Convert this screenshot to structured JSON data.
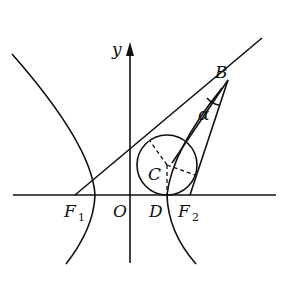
{
  "diagram": {
    "type": "hyperbola-focal-triangle",
    "axes": {
      "x_label": "",
      "y_label": "y",
      "origin_label": "O"
    },
    "points": {
      "F1": {
        "label": "F",
        "sub": "1"
      },
      "F2": {
        "label": "F",
        "sub": "2"
      },
      "O": {
        "label": "O"
      },
      "D": {
        "label": "D"
      },
      "C": {
        "label": "C"
      },
      "B": {
        "label": "B"
      }
    },
    "angle_label": "α",
    "elements": [
      "hyperbola left branch",
      "hyperbola right branch",
      "line F1B extended",
      "segment BF2",
      "segment BC (angle bisector)",
      "incircle centered at C tangent to x-axis at D",
      "dashed radii from C to tangent points"
    ],
    "colors": {
      "stroke": "#111111",
      "background": "#ffffff"
    }
  }
}
